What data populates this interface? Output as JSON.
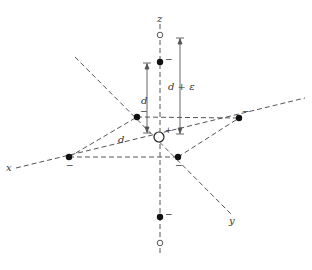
{
  "diagram": {
    "colors": {
      "line": "#555555",
      "dot": "#111111",
      "background": "#ffffff"
    },
    "axes": {
      "x_label": "x",
      "y_label": "y",
      "z_label": "z"
    },
    "center": {
      "sign": "+"
    },
    "charges": [
      {
        "id": "top-axial",
        "sign": "−"
      },
      {
        "id": "bottom-axial",
        "sign": "−"
      },
      {
        "id": "equatorial-back-left",
        "sign": "−"
      },
      {
        "id": "equatorial-right",
        "sign": "−"
      },
      {
        "id": "equatorial-left",
        "sign": "−"
      },
      {
        "id": "equatorial-front-right",
        "sign": "−"
      }
    ],
    "dimensions": {
      "equatorial_distance": "d",
      "axial_distance_short": "d",
      "axial_distance_long": "d + ε"
    }
  }
}
